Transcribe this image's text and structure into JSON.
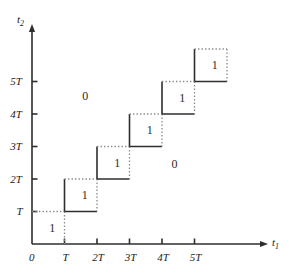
{
  "figure": {
    "kind": "staircase-region-diagram",
    "background_color": "#ffffff",
    "line_color": "#3a3a3a",
    "solid_line_color": "#2e2e2e",
    "dotted_line_color": "#8a8a8a",
    "text_color": "#1c1c1c"
  },
  "axes": {
    "x": {
      "name": "t",
      "subscript": "1",
      "origin_label": "0",
      "ticks": [
        {
          "label": "T",
          "value": 1
        },
        {
          "label": "2T",
          "value": 2
        },
        {
          "label": "3T",
          "value": 3
        },
        {
          "label": "4T",
          "value": 4
        },
        {
          "label": "5T",
          "value": 5
        }
      ],
      "arrow": true
    },
    "y": {
      "name": "t",
      "subscript": "2",
      "ticks": [
        {
          "label": "T",
          "value": 1
        },
        {
          "label": "2T",
          "value": 2
        },
        {
          "label": "3T",
          "value": 3
        },
        {
          "label": "4T",
          "value": 4
        },
        {
          "label": "5T",
          "value": 5
        }
      ],
      "arrow": true
    }
  },
  "chart_data": {
    "type": "line",
    "title": "",
    "xlabel": "t1",
    "ylabel": "t2",
    "xlim": [
      0,
      6
    ],
    "ylim": [
      0,
      6
    ],
    "grid": false,
    "unit": "T",
    "staircase_boxes": [
      {
        "x0": 0,
        "y0": 0,
        "x1": 1,
        "y1": 1,
        "label": "1"
      },
      {
        "x0": 1,
        "y0": 1,
        "x1": 2,
        "y1": 2,
        "label": "1"
      },
      {
        "x0": 2,
        "y0": 2,
        "x1": 3,
        "y1": 3,
        "label": "1"
      },
      {
        "x0": 3,
        "y0": 3,
        "x1": 4,
        "y1": 4,
        "label": "1"
      },
      {
        "x0": 4,
        "y0": 4,
        "x1": 5,
        "y1": 5,
        "label": "1"
      },
      {
        "x0": 5,
        "y0": 5,
        "x1": 6,
        "y1": 6,
        "label": "1"
      }
    ],
    "region_labels": [
      {
        "label": "0",
        "x": 1.65,
        "y": 4.55
      },
      {
        "label": "0",
        "x": 4.4,
        "y": 2.45
      }
    ],
    "edge_styles": {
      "left": "solid",
      "bottom": "solid",
      "top": "dotted",
      "right": "dotted"
    }
  }
}
